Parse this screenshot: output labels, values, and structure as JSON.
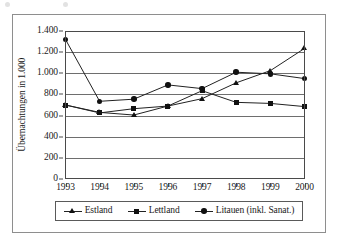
{
  "chart_data": {
    "type": "line",
    "title": "",
    "xlabel": "",
    "ylabel": "Übernachtungen in 1.000",
    "categories": [
      "1993",
      "1994",
      "1995",
      "1996",
      "1997",
      "1998",
      "1999",
      "2000"
    ],
    "x": [
      1993,
      1994,
      1995,
      1996,
      1997,
      1998,
      1999,
      2000
    ],
    "ylim": [
      0,
      1400
    ],
    "y_ticks": [
      0,
      200,
      400,
      600,
      800,
      1000,
      1200,
      1400
    ],
    "y_tick_labels": [
      "0",
      "200",
      "400",
      "600",
      "800",
      "1.000",
      "1.200",
      "1.400"
    ],
    "grid": "horizontal",
    "legend_position": "bottom",
    "series": [
      {
        "name": "Estland",
        "marker": "triangle",
        "values": [
          700,
          630,
          605,
          690,
          760,
          910,
          1025,
          1235
        ]
      },
      {
        "name": "Lettland",
        "marker": "square",
        "values": [
          700,
          625,
          665,
          690,
          835,
          725,
          715,
          685
        ]
      },
      {
        "name": "Litauen (inkl. Sanat.)",
        "marker": "circle",
        "values": [
          1320,
          735,
          755,
          890,
          855,
          1010,
          995,
          950
        ]
      }
    ],
    "colors": {
      "line": "#222222",
      "marker": "#111111",
      "grid": "#6e6e6e",
      "axis": "#4a4a4a",
      "frame": "#8e8e8e",
      "background": "#ffffff"
    }
  }
}
